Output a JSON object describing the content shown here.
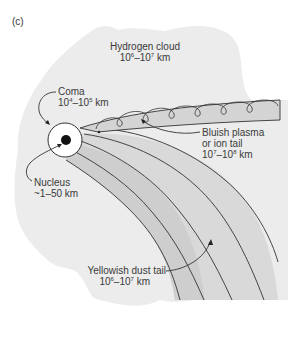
{
  "figure": {
    "panel_label": "(c)",
    "colors": {
      "hydrogen_cloud": "#ececec",
      "dust_tail": "#d2d2d2",
      "dust_tail_light": "#dcdcdc",
      "plasma_tail": "#d6d6d6",
      "coma": "#ffffff",
      "nucleus": "#111111",
      "lines": "#333333",
      "text": "#3a3a3a"
    }
  },
  "labels": {
    "hydrogen_cloud": {
      "name": "Hydrogen cloud",
      "size_base1": "10",
      "size_exp1": "6",
      "size_sep": "–",
      "size_base2": "10",
      "size_exp2": "7",
      "size_unit": " km"
    },
    "coma": {
      "name": "Coma",
      "size_base1": "10",
      "size_exp1": "4",
      "size_sep": "–",
      "size_base2": "10",
      "size_exp2": "5",
      "size_unit": " km"
    },
    "nucleus": {
      "name": "Nucleus",
      "size": "~1–50 km"
    },
    "plasma_tail": {
      "line1": "Bluish plasma",
      "line2": "or ion tail",
      "size_base1": "10",
      "size_exp1": "7",
      "size_sep": "–",
      "size_base2": "10",
      "size_exp2": "8",
      "size_unit": " km"
    },
    "dust_tail": {
      "name": "Yellowish dust tail",
      "size_base1": "10",
      "size_exp1": "6",
      "size_sep": "–",
      "size_base2": "10",
      "size_exp2": "7",
      "size_unit": " km"
    }
  }
}
